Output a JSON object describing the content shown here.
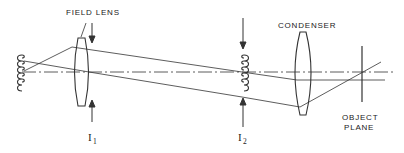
{
  "diagram": {
    "type": "optical-ray-diagram",
    "colors": {
      "line": "#333333",
      "background": "#ffffff"
    },
    "labels": {
      "field_lens": "FIELD LENS",
      "condenser": "CONDENSER",
      "object_plane_line1": "OBJECT",
      "object_plane_line2": "PLANE",
      "image1_main": "I",
      "image1_sub": "1",
      "image2_main": "I",
      "image2_sub": "2"
    },
    "components": [
      {
        "id": "source-filament",
        "kind": "coil",
        "x": 20
      },
      {
        "id": "field-lens",
        "kind": "biconvex-lens",
        "x": 82
      },
      {
        "id": "image-I1",
        "kind": "arrow-pair",
        "x": 92
      },
      {
        "id": "filament-image-I2",
        "kind": "coil",
        "x": 242
      },
      {
        "id": "condenser",
        "kind": "biconvex-lens",
        "x": 303
      },
      {
        "id": "object-plane",
        "kind": "plane-line",
        "x": 362
      }
    ]
  }
}
